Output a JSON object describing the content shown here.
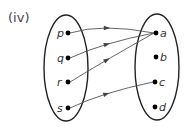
{
  "diagram": {
    "title": "(iv)",
    "type": "mapping",
    "colors": {
      "stroke": "#222222",
      "arrow": "#555555",
      "dot": "#000000",
      "label": "#333333"
    },
    "domain": {
      "ellipse": {
        "cx": 66,
        "cy": 68,
        "rx": 22,
        "ry": 53
      },
      "elements": [
        {
          "id": "p",
          "label": "p",
          "x": 68,
          "y": 33
        },
        {
          "id": "q",
          "label": "q",
          "x": 68,
          "y": 58
        },
        {
          "id": "r",
          "label": "r",
          "x": 68,
          "y": 82
        },
        {
          "id": "s",
          "label": "s",
          "x": 68,
          "y": 108
        }
      ]
    },
    "codomain": {
      "ellipse": {
        "cx": 157,
        "cy": 67,
        "rx": 22,
        "ry": 53
      },
      "elements": [
        {
          "id": "a",
          "label": "a",
          "x": 156,
          "y": 33
        },
        {
          "id": "b",
          "label": "b",
          "x": 156,
          "y": 57
        },
        {
          "id": "c",
          "label": "c",
          "x": 155,
          "y": 82
        },
        {
          "id": "d",
          "label": "d",
          "x": 155,
          "y": 107
        }
      ]
    },
    "mappings": [
      {
        "from": "p",
        "to": "a"
      },
      {
        "from": "q",
        "to": "a"
      },
      {
        "from": "r",
        "to": "a"
      },
      {
        "from": "s",
        "to": "c"
      }
    ]
  }
}
